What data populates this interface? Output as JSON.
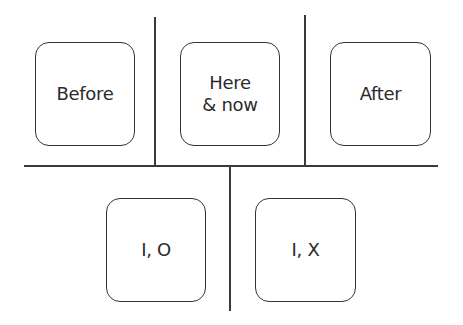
{
  "diagram": {
    "top_row": [
      {
        "label": "Before"
      },
      {
        "label": "Here\n& now"
      },
      {
        "label": "After"
      }
    ],
    "bottom_row": [
      {
        "label": "I, O"
      },
      {
        "label": "I, X"
      }
    ],
    "colors": {
      "line": "#3a3a3a",
      "box_border": "#333333",
      "text": "#2b2b2b",
      "background": "#ffffff"
    }
  }
}
